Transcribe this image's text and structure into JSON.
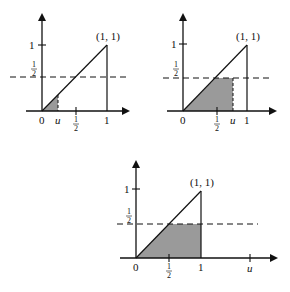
{
  "figure": {
    "colors": {
      "ink": "#111111",
      "shade": "#9a9a9a",
      "background": "#ffffff"
    },
    "common_labels": {
      "point": "(1, 1)",
      "y_one": "1",
      "half_num": "1",
      "half_den": "2",
      "origin": "0",
      "x_one": "1",
      "u": "u"
    },
    "panels": [
      {
        "id": "case-u-less-than-half",
        "u_value": "u < 1/2",
        "shaded_region": "triangle under y=x from 0 to u"
      },
      {
        "id": "case-u-between-half-and-one",
        "u_value": "1/2 < u < 1",
        "shaded_region": "region under min(x, 1/2) from 0 to u"
      },
      {
        "id": "case-u-greater-than-one",
        "u_value": "u > 1",
        "shaded_region": "region under min(x, 1/2) from 0 to 1"
      }
    ]
  }
}
